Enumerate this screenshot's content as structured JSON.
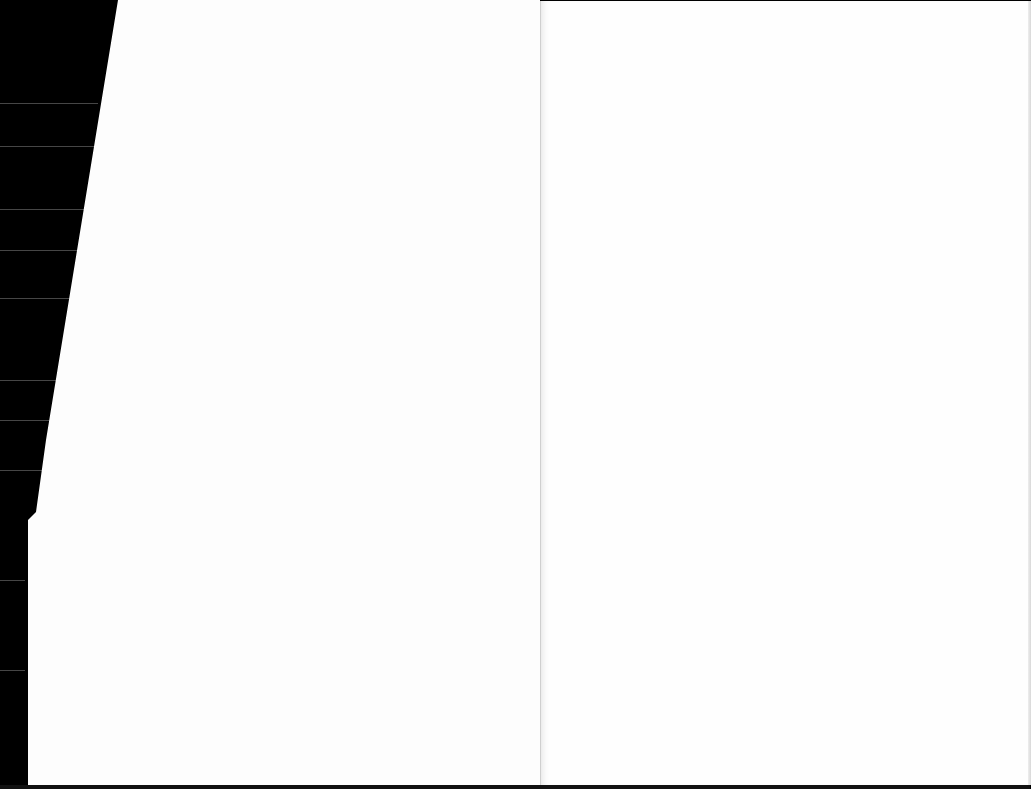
{
  "scene": {
    "description": "Open book spread with two blank white pages on a black background",
    "background_color": "#000000",
    "page_color": "#fdfdfd",
    "gutter_color": "#cfcfcf"
  }
}
